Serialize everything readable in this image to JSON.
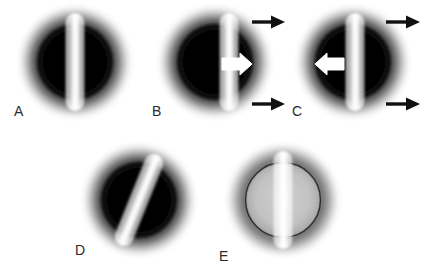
{
  "figure": {
    "caption_letters": [
      "A",
      "B",
      "C",
      "D",
      "E"
    ],
    "background_color": "#ffffff",
    "label_color": "#2b2b2b",
    "halo_color": "#3a3a3a",
    "disk_color": "#050505",
    "bar_color": "#fdfdfd",
    "arrow_black_color": "#111111",
    "arrow_white_color": "#ffffff",
    "ring_light_color": "#5d5d5d"
  },
  "panels": [
    {
      "id": "A",
      "label": "A",
      "label_x": 14,
      "label_y": 104,
      "center_x": 75,
      "center_y": 62,
      "halo_r": 55,
      "disk_r": 38,
      "disk_fill": "#050505",
      "bar_x_offset": 0,
      "bar_angle": 0,
      "bar_width": 19,
      "bar_height": 98,
      "white_arrow": "none",
      "black_arrows": 0,
      "ring_style": "dark-disk"
    },
    {
      "id": "B",
      "label": "B",
      "label_x": 152,
      "label_y": 104,
      "center_x": 215,
      "center_y": 62,
      "halo_r": 55,
      "disk_r": 38,
      "disk_fill": "#050505",
      "bar_x_offset": 14,
      "bar_angle": 0,
      "bar_width": 19,
      "bar_height": 98,
      "white_arrow": "right",
      "white_arrow_x": 222,
      "white_arrow_y": 64,
      "black_arrows": 2,
      "ring_style": "dark-disk"
    },
    {
      "id": "C",
      "label": "C",
      "label_x": 292,
      "label_y": 104,
      "center_x": 353,
      "center_y": 62,
      "halo_r": 55,
      "disk_r": 38,
      "disk_fill": "#050505",
      "bar_x_offset": 2,
      "bar_angle": 0,
      "bar_width": 19,
      "bar_height": 98,
      "white_arrow": "left",
      "white_arrow_x": 320,
      "white_arrow_y": 64,
      "black_arrows": 2,
      "ring_style": "dark-disk"
    },
    {
      "id": "D",
      "label": "D",
      "label_x": 75,
      "label_y": 243,
      "center_x": 139,
      "center_y": 200,
      "halo_r": 55,
      "disk_r": 38,
      "disk_fill": "#050505",
      "bar_x_offset": 0,
      "bar_angle": 22,
      "bar_width": 19,
      "bar_height": 98,
      "white_arrow": "none",
      "black_arrows": 0,
      "ring_style": "dark-disk"
    },
    {
      "id": "E",
      "label": "E",
      "label_x": 219,
      "label_y": 249,
      "center_x": 283,
      "center_y": 200,
      "halo_r": 55,
      "disk_r": 38,
      "disk_fill": "#bdbdbd",
      "bar_x_offset": 0,
      "bar_angle": 0,
      "bar_width": 19,
      "bar_height": 98,
      "white_arrow": "none",
      "black_arrows": 0,
      "ring_style": "light-outline"
    }
  ],
  "arrows": {
    "panel_b": [
      {
        "name": "top-motion-arrow",
        "x1": 252,
        "y": 22,
        "x2": 283,
        "direction": "right"
      },
      {
        "name": "bottom-motion-arrow",
        "x1": 252,
        "y": 104,
        "x2": 283,
        "direction": "right"
      }
    ],
    "panel_c": [
      {
        "name": "top-motion-arrow",
        "x1": 386,
        "y": 22,
        "x2": 419,
        "direction": "right"
      },
      {
        "name": "bottom-motion-arrow",
        "x1": 386,
        "y": 104,
        "x2": 419,
        "direction": "right"
      }
    ]
  }
}
